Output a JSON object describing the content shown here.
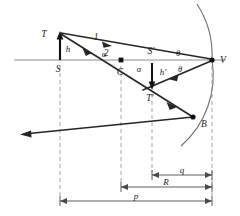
{
  "figure": {
    "type": "optics-ray-diagram"
  },
  "points": {
    "object_top": "T",
    "object_base": "S",
    "center_of_curvature": "C",
    "image_base": "S'",
    "image_top": "T'",
    "vertex": "V",
    "reflection_point": "B"
  },
  "heights": {
    "object": "h",
    "image": "h'"
  },
  "rays": {
    "ray_one": "1",
    "ray_two": "2"
  },
  "angles": {
    "alpha_upper": "α",
    "alpha_lower": "α",
    "theta_upper": "θ",
    "theta_lower": "θ"
  },
  "dimensions": {
    "image_distance": "q",
    "radius_of_curvature": "R",
    "object_distance": "p"
  },
  "colors": {
    "ray": "#262626",
    "axis": "#8c8c8c",
    "mirror": "#6f6f6f",
    "dashed": "#9a9a9a",
    "dimension": "#4a4a4a",
    "background": "#ffffff"
  },
  "geometry": {
    "axis_y": 60,
    "vertex_x": 212,
    "object_base_x": 60,
    "center_x": 121,
    "image_base_x": 152,
    "object_top_y": 33,
    "image_top_y": 88,
    "reflection_b": [
      193,
      117
    ],
    "dim_q_y": 175,
    "dim_R_y": 187,
    "dim_p_y": 201
  }
}
